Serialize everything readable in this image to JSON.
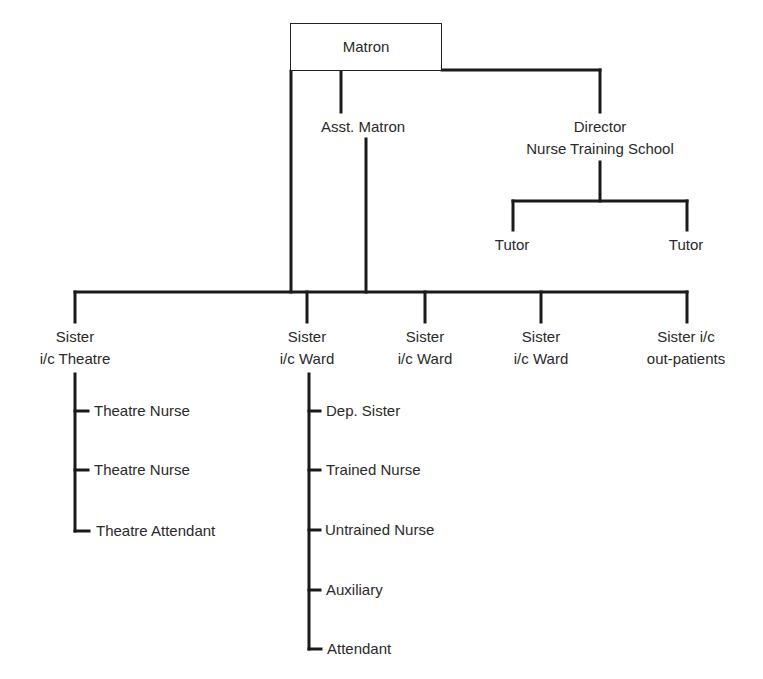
{
  "chart": {
    "top": {
      "label": "Matron"
    },
    "assistant": {
      "label": "Asst. Matron"
    },
    "director": {
      "line1": "Director",
      "line2": "Nurse Training School"
    },
    "tutors": [
      {
        "label": "Tutor"
      },
      {
        "label": "Tutor"
      }
    ],
    "sisters": [
      {
        "line1": "Sister",
        "line2": "i/c Theatre"
      },
      {
        "line1": "Sister",
        "line2": "i/c Ward"
      },
      {
        "line1": "Sister",
        "line2": "i/c Ward"
      },
      {
        "line1": "Sister",
        "line2": "i/c Ward"
      },
      {
        "line1": "Sister i/c",
        "line2": "out-patients"
      }
    ],
    "theatre_staff": [
      {
        "label": "Theatre Nurse"
      },
      {
        "label": "Theatre Nurse"
      },
      {
        "label": "Theatre Attendant"
      }
    ],
    "ward_staff": [
      {
        "label": "Dep. Sister"
      },
      {
        "label": "Trained Nurse"
      },
      {
        "label": "Untrained Nurse"
      },
      {
        "label": "Auxiliary"
      },
      {
        "label": "Attendant"
      }
    ],
    "line_color": "#1a1a1a"
  }
}
